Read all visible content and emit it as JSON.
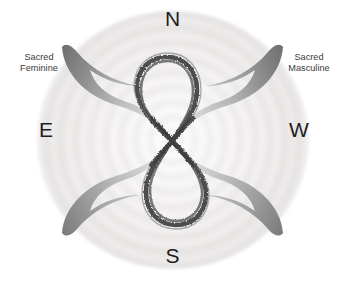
{
  "diagram": {
    "background_color": "#ffffff",
    "halo_color": "#d8d2d2",
    "cardinals": {
      "north": "N",
      "south": "S",
      "east": "E",
      "west": "W"
    },
    "side_labels": {
      "left": "Sacred\nFeminine",
      "right": "Sacred\nMasculine"
    },
    "symbols": {
      "infinity": {
        "name": "ink-brush-lemniscate",
        "orientation": "vertical",
        "color": "#4a4a4a"
      },
      "crescents": {
        "name": "four-crescent-horns",
        "count": 4,
        "gradient_from": "#6f6f6f",
        "gradient_to": "#d9d9d9"
      }
    }
  }
}
